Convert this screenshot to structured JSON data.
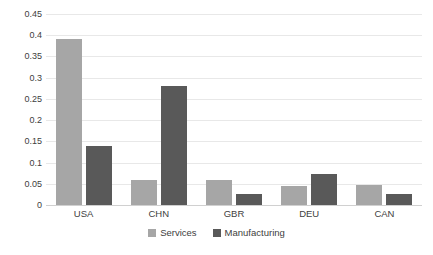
{
  "chart_data": {
    "type": "bar",
    "title": "",
    "xlabel": "",
    "ylabel": "",
    "categories": [
      "USA",
      "CHN",
      "GBR",
      "DEU",
      "CAN"
    ],
    "series": [
      {
        "name": "Services",
        "color": "#a6a6a6",
        "values": [
          0.39,
          0.06,
          0.06,
          0.045,
          0.047
        ]
      },
      {
        "name": "Manufacturing",
        "color": "#595959",
        "values": [
          0.14,
          0.28,
          0.027,
          0.072,
          0.027
        ]
      }
    ],
    "ylim": [
      0,
      0.45
    ],
    "ytick_labels": [
      "0.45",
      "0.4",
      "0.35",
      "0.3",
      "0.25",
      "0.2",
      "0.15",
      "0.1",
      "0.05",
      "0"
    ],
    "ytick_values": [
      0.45,
      0.4,
      0.35,
      0.3,
      0.25,
      0.2,
      0.15,
      0.1,
      0.05,
      0
    ],
    "grid": true,
    "grid_color": "#e8e8e8",
    "legend_position": "bottom",
    "background": "#ffffff"
  }
}
